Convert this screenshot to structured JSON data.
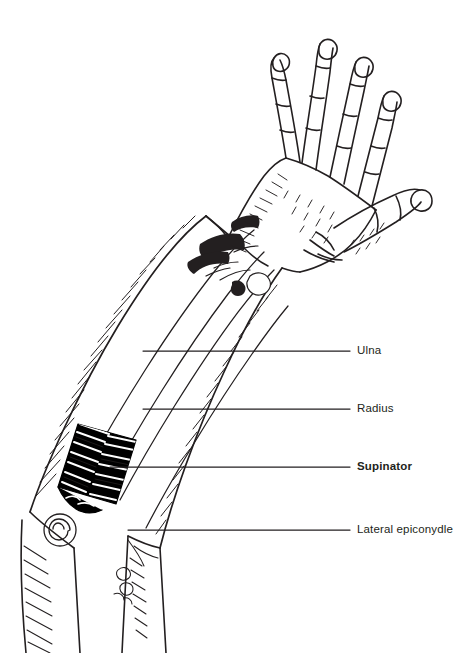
{
  "figure": {
    "background_color": "#ffffff",
    "ink_color": "#231f20",
    "highlight_color": "#000000"
  },
  "labels": {
    "ulna": "Ulna",
    "radius": "Radius",
    "supinator": "Supinator",
    "lateral_epicondyle": "Lateral epiconydle"
  },
  "leader_lines": [
    {
      "name": "ulna",
      "x1": 143,
      "y1": 351,
      "x2": 350,
      "y2": 351
    },
    {
      "name": "radius",
      "x1": 143,
      "y1": 409,
      "x2": 350,
      "y2": 409
    },
    {
      "name": "supinator",
      "x1": 110,
      "y1": 467,
      "x2": 350,
      "y2": 467
    },
    {
      "name": "lateral-epicondyle",
      "x1": 128,
      "y1": 530,
      "x2": 350,
      "y2": 530
    }
  ]
}
